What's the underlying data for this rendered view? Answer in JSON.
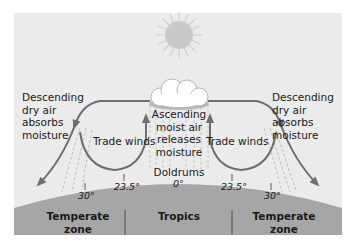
{
  "labels": {
    "left_descending": [
      "Descending",
      "dry air",
      "absorbs",
      "moisture"
    ],
    "right_descending": [
      "Descending",
      "dry air",
      "absorbs",
      "moisture"
    ],
    "left_trade": "Trade winds",
    "right_trade": "Trade winds",
    "ascending": [
      "Ascending",
      "moist air",
      "releases",
      "moisture"
    ],
    "doldrums": "Doldrums"
  },
  "latitudes": {
    "left_30": "30°",
    "left_23": "23.5°",
    "equator": "0°",
    "right_23": "23.5°",
    "right_30": "30°"
  },
  "zones": {
    "left": [
      "Temperate",
      "zone"
    ],
    "center": "Tropics",
    "right": [
      "Temperate",
      "zone"
    ]
  },
  "colors": {
    "background": "#ebebeb",
    "ground": "#a6a6a6",
    "arrow": "#6e6e6e",
    "sun": "#cfcfcf",
    "cloud": "#ffffff"
  }
}
